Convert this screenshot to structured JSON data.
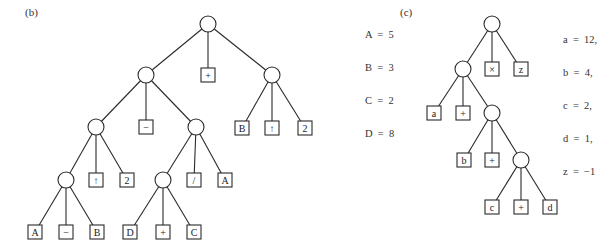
{
  "panels": [
    {
      "id": "b",
      "label": "(b)",
      "label_pos": [
        25,
        12
      ],
      "legend_pos": [
        365,
        12
      ],
      "legend": [
        "A  =  5",
        "B  =  3",
        "C  =  2",
        "D  =  8"
      ],
      "nodes": [
        {
          "id": "r",
          "type": "circle",
          "x": 208,
          "y": 24
        },
        {
          "id": "L",
          "type": "circle",
          "x": 146,
          "y": 75
        },
        {
          "id": "p1",
          "type": "box",
          "label": "+",
          "x": 208,
          "y": 75
        },
        {
          "id": "R",
          "type": "circle",
          "x": 272,
          "y": 75
        },
        {
          "id": "RB",
          "type": "box",
          "label": "B",
          "x": 242,
          "y": 128
        },
        {
          "id": "Rup",
          "type": "box",
          "label": "↑",
          "x": 272,
          "y": 128
        },
        {
          "id": "R2",
          "type": "box",
          "label": "2",
          "x": 305,
          "y": 128
        },
        {
          "id": "LL",
          "type": "circle",
          "x": 96,
          "y": 127
        },
        {
          "id": "Lm",
          "type": "box",
          "label": "−",
          "x": 146,
          "y": 127
        },
        {
          "id": "LR",
          "type": "circle",
          "x": 196,
          "y": 127
        },
        {
          "id": "LLL",
          "type": "circle",
          "x": 66,
          "y": 180
        },
        {
          "id": "LLup",
          "type": "box",
          "label": "↑",
          "x": 96,
          "y": 180
        },
        {
          "id": "LL2",
          "type": "box",
          "label": "2",
          "x": 127,
          "y": 180
        },
        {
          "id": "LRL",
          "type": "circle",
          "x": 163,
          "y": 180
        },
        {
          "id": "LRd",
          "type": "box",
          "label": "/",
          "x": 194,
          "y": 180
        },
        {
          "id": "LRA",
          "type": "box",
          "label": "A",
          "x": 225,
          "y": 180
        },
        {
          "id": "a1",
          "type": "box",
          "label": "A",
          "x": 35,
          "y": 232
        },
        {
          "id": "a2",
          "type": "box",
          "label": "−",
          "x": 66,
          "y": 232
        },
        {
          "id": "a3",
          "type": "box",
          "label": "B",
          "x": 97,
          "y": 232
        },
        {
          "id": "b1",
          "type": "box",
          "label": "D",
          "x": 130,
          "y": 232
        },
        {
          "id": "b2",
          "type": "box",
          "label": "+",
          "x": 163,
          "y": 232
        },
        {
          "id": "b3",
          "type": "box",
          "label": "C",
          "x": 194,
          "y": 232
        }
      ],
      "edges": [
        [
          "r",
          "L"
        ],
        [
          "r",
          "p1"
        ],
        [
          "r",
          "R"
        ],
        [
          "R",
          "RB"
        ],
        [
          "R",
          "Rup"
        ],
        [
          "R",
          "R2"
        ],
        [
          "L",
          "LL"
        ],
        [
          "L",
          "Lm"
        ],
        [
          "L",
          "LR"
        ],
        [
          "LL",
          "LLL"
        ],
        [
          "LL",
          "LLup"
        ],
        [
          "LL",
          "LL2"
        ],
        [
          "LR",
          "LRL"
        ],
        [
          "LR",
          "LRd"
        ],
        [
          "LR",
          "LRA"
        ],
        [
          "LLL",
          "a1"
        ],
        [
          "LLL",
          "a2"
        ],
        [
          "LLL",
          "a3"
        ],
        [
          "LRL",
          "b1"
        ],
        [
          "LRL",
          "b2"
        ],
        [
          "LRL",
          "b3"
        ]
      ]
    },
    {
      "id": "c",
      "label": "(c)",
      "label_pos": [
        400,
        12
      ],
      "legend_pos": [
        563,
        17
      ],
      "legend": [
        "a  =  12,",
        "b  =  4,",
        "c  =  2,",
        "d  =  1,",
        "z  =  −1"
      ],
      "nodes": [
        {
          "id": "r",
          "type": "circle",
          "x": 492,
          "y": 24
        },
        {
          "id": "n1",
          "type": "circle",
          "x": 463,
          "y": 69
        },
        {
          "id": "x",
          "type": "box",
          "label": "×",
          "x": 492,
          "y": 69
        },
        {
          "id": "z",
          "type": "box",
          "label": "z",
          "x": 521,
          "y": 69
        },
        {
          "id": "a",
          "type": "box",
          "label": "a",
          "x": 434,
          "y": 113
        },
        {
          "id": "p1",
          "type": "box",
          "label": "+",
          "x": 463,
          "y": 113
        },
        {
          "id": "n2",
          "type": "circle",
          "x": 492,
          "y": 113
        },
        {
          "id": "b",
          "type": "box",
          "label": "b",
          "x": 464,
          "y": 160
        },
        {
          "id": "p2",
          "type": "box",
          "label": "+",
          "x": 492,
          "y": 160
        },
        {
          "id": "n3",
          "type": "circle",
          "x": 521,
          "y": 160
        },
        {
          "id": "c",
          "type": "box",
          "label": "c",
          "x": 492,
          "y": 207
        },
        {
          "id": "p3",
          "type": "box",
          "label": "+",
          "x": 521,
          "y": 207
        },
        {
          "id": "d",
          "type": "box",
          "label": "d",
          "x": 550,
          "y": 207
        }
      ],
      "edges": [
        [
          "r",
          "n1"
        ],
        [
          "r",
          "x"
        ],
        [
          "r",
          "z"
        ],
        [
          "n1",
          "a"
        ],
        [
          "n1",
          "p1"
        ],
        [
          "n1",
          "n2"
        ],
        [
          "n2",
          "b"
        ],
        [
          "n2",
          "p2"
        ],
        [
          "n2",
          "n3"
        ],
        [
          "n3",
          "c"
        ],
        [
          "n3",
          "p3"
        ],
        [
          "n3",
          "d"
        ]
      ]
    }
  ],
  "style": {
    "circle_radius": 8,
    "box_size": 14,
    "stroke": "#2a2a2a"
  }
}
